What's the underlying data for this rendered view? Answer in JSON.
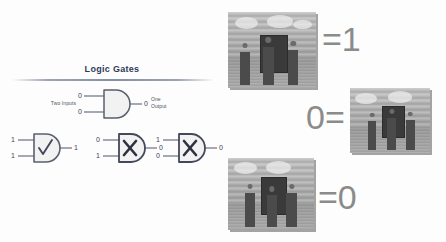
{
  "canvas": {
    "width": 446,
    "height": 242,
    "background": "#fdfdfd"
  },
  "diagram": {
    "title": "Logic Gates",
    "title_color": "#2f3a5a",
    "inputs_label": "Two Inputs",
    "output_label_line1": "One",
    "output_label_line2": "Output",
    "gates": [
      {
        "id": "gate-top",
        "name": "and-gate-demo",
        "symbol": "none",
        "input_top": "0",
        "input_bottom": "0",
        "output": "0"
      },
      {
        "id": "gate-a",
        "name": "and-gate-true",
        "symbol": "check",
        "input_top": "1",
        "input_bottom": "1",
        "output": "1"
      },
      {
        "id": "gate-b",
        "name": "and-gate-false-01",
        "symbol": "cross",
        "input_top": "0",
        "input_bottom": "1",
        "output": "0"
      },
      {
        "id": "gate-c",
        "name": "and-gate-false-10",
        "symbol": "cross",
        "input_top": "1",
        "input_bottom": "0",
        "output": "0"
      }
    ]
  },
  "collage": {
    "panels": [
      {
        "id": "photo-top",
        "name": "photo-top-left",
        "equation": "=1",
        "equation_position": "right",
        "caption": ""
      },
      {
        "id": "photo-mid",
        "name": "photo-middle-right",
        "equation": "0=",
        "equation_position": "left",
        "caption": ""
      },
      {
        "id": "photo-bottom",
        "name": "photo-bottom-left",
        "equation": "=0",
        "equation_position": "right",
        "caption": ""
      }
    ],
    "equation_color": "#8b8b8b"
  }
}
